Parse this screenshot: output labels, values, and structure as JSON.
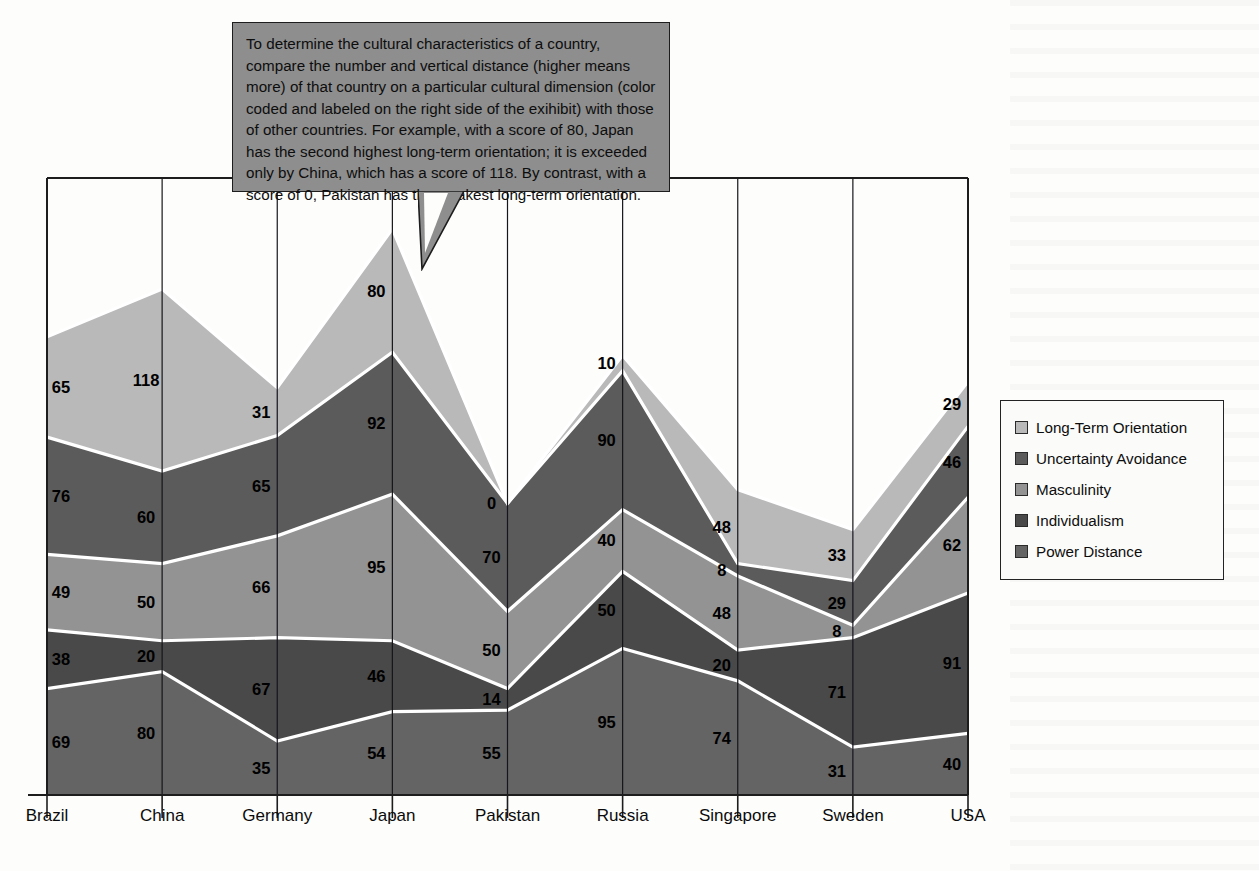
{
  "callout": {
    "text": "To determine the cultural characteristics of a country, compare the number and vertical distance (higher means more) of that country on a particular cultural dimension (color coded and labeled on the right side of the exihibit) with those of other countries.  For example, with a score of 80, Japan has the second highest long-term orientation; it is exceeded only by China, which has a score of 118.  By contrast, with a score of 0, Pakistan has the weakest long-term orientation."
  },
  "legend": {
    "position": "right",
    "items": [
      {
        "label": "Long-Term Orientation",
        "color": "#b9b9b9"
      },
      {
        "label": "Uncertainty Avoidance",
        "color": "#5b5b5b"
      },
      {
        "label": "Masculinity",
        "color": "#939393"
      },
      {
        "label": "Individualism",
        "color": "#494949"
      },
      {
        "label": "Power Distance",
        "color": "#646464"
      }
    ]
  },
  "chart_data": {
    "type": "area",
    "stacked": true,
    "title": "",
    "xlabel": "",
    "ylabel": "",
    "grid": false,
    "categories": [
      "Brazil",
      "China",
      "Germany",
      "Japan",
      "Pakistan",
      "Russia",
      "Singapore",
      "Sweden",
      "USA"
    ],
    "stack_order_bottom_to_top": [
      "Power Distance",
      "Individualism",
      "Masculinity",
      "Uncertainty Avoidance",
      "Long-Term Orientation"
    ],
    "series": [
      {
        "name": "Long-Term Orientation",
        "color": "#b9b9b9",
        "values": [
          65,
          118,
          31,
          80,
          0,
          10,
          48,
          33,
          29
        ]
      },
      {
        "name": "Uncertainty Avoidance",
        "color": "#5b5b5b",
        "values": [
          76,
          60,
          65,
          92,
          70,
          90,
          8,
          29,
          46
        ]
      },
      {
        "name": "Masculinity",
        "color": "#939393",
        "values": [
          49,
          50,
          66,
          95,
          50,
          40,
          48,
          8,
          62
        ]
      },
      {
        "name": "Individualism",
        "color": "#494949",
        "values": [
          38,
          20,
          67,
          46,
          14,
          50,
          20,
          71,
          91
        ]
      },
      {
        "name": "Power Distance",
        "color": "#646464",
        "values": [
          69,
          80,
          35,
          54,
          55,
          95,
          74,
          31,
          40
        ]
      }
    ],
    "ylim": [
      0,
      400
    ]
  },
  "colors": {
    "plot_border": "#1d1d1d",
    "band_divider": "#ffffff",
    "callout_fill": "#8e8e8e",
    "page_background": "#fdfdfc"
  }
}
